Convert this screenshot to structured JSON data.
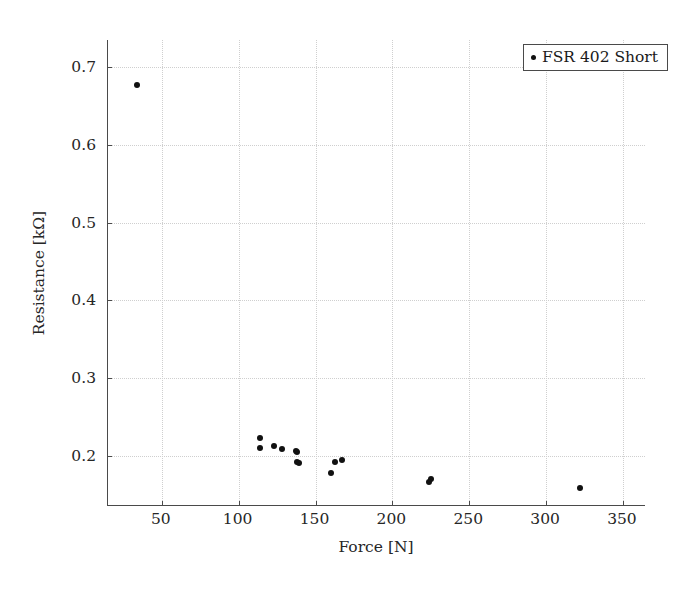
{
  "chart_data": {
    "type": "scatter",
    "title": "",
    "xlabel": "Force [N]",
    "ylabel": "Resistance [kΩ]",
    "xlim": [
      15,
      365
    ],
    "ylim": [
      0.135,
      0.735
    ],
    "xticks": [
      50,
      100,
      150,
      200,
      250,
      300,
      350
    ],
    "yticks": [
      0.2,
      0.3,
      0.4,
      0.5,
      0.6,
      0.7
    ],
    "xticklabels": [
      "50",
      "100",
      "150",
      "200",
      "250",
      "300",
      "350"
    ],
    "yticklabels": [
      "0.2",
      "0.3",
      "0.4",
      "0.5",
      "0.6",
      "0.7"
    ],
    "grid": true,
    "grid_style": "dotted",
    "legend_position": "upper right",
    "marker_color": "#111111",
    "marker": "circle",
    "series": [
      {
        "name": "FSR 402 Short",
        "x": [
          34,
          114,
          114,
          123,
          128,
          137,
          138,
          138,
          139,
          160,
          163,
          167,
          224,
          225,
          322
        ],
        "y": [
          0.677,
          0.222,
          0.21,
          0.212,
          0.208,
          0.206,
          0.205,
          0.192,
          0.19,
          0.177,
          0.192,
          0.194,
          0.166,
          0.17,
          0.158
        ]
      }
    ]
  },
  "legend": {
    "entries": [
      {
        "label": "FSR 402 Short",
        "marker": "dot",
        "color": "#111111"
      }
    ]
  },
  "axes": {
    "x_axis_label": "Force [N]",
    "y_axis_label": "Resistance [kΩ]"
  }
}
